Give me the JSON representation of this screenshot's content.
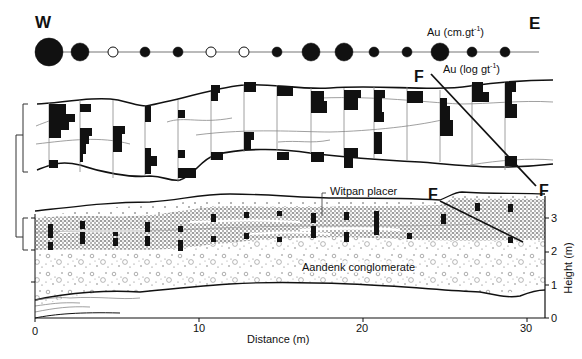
{
  "labels": {
    "west": "W",
    "east": "E",
    "au_accumulation": "Au (cm.gt",
    "au_accumulation_sup": "-1",
    "au_accumulation_close": ")",
    "au_log": "Au (log gt",
    "au_log_sup": "-1",
    "au_log_close": ")",
    "fault_upper": "F",
    "fault_upper_end": "F",
    "fault_lower": "F",
    "fault_lower_end": "F",
    "witpan_placer": "Witpan placer",
    "aandenk_conglomerate": "Aandenk conglomerate",
    "x_axis_title": "Distance (m)",
    "y_axis_title": "Height (m)"
  },
  "x_axis": {
    "ticks": [
      "0",
      "10",
      "20",
      "30"
    ],
    "range": [
      0,
      31
    ]
  },
  "y_axis": {
    "ticks": [
      "0",
      "1",
      "2",
      "3"
    ],
    "range": [
      0,
      3.3
    ]
  },
  "au_circles": [
    {
      "x": 49,
      "r": 14,
      "filled": true
    },
    {
      "x": 80,
      "r": 9,
      "filled": true
    },
    {
      "x": 113,
      "r": 5,
      "filled": false
    },
    {
      "x": 145,
      "r": 5,
      "filled": true
    },
    {
      "x": 178,
      "r": 5,
      "filled": true
    },
    {
      "x": 211,
      "r": 5,
      "filled": false
    },
    {
      "x": 244,
      "r": 5,
      "filled": false
    },
    {
      "x": 277,
      "r": 5,
      "filled": true
    },
    {
      "x": 311,
      "r": 9,
      "filled": true
    },
    {
      "x": 344,
      "r": 9,
      "filled": true
    },
    {
      "x": 374,
      "r": 5,
      "filled": true
    },
    {
      "x": 407,
      "r": 5,
      "filled": true
    },
    {
      "x": 440,
      "r": 9,
      "filled": true
    },
    {
      "x": 472,
      "r": 5,
      "filled": true
    },
    {
      "x": 505,
      "r": 5,
      "filled": true
    }
  ],
  "colors": {
    "ink": "#111111",
    "thin_line": "#777777",
    "background": "#ffffff"
  }
}
